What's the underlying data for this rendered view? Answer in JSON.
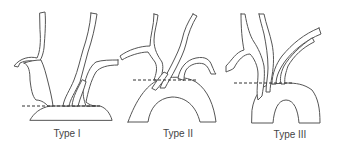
{
  "figure": {
    "panels": [
      {
        "id": "type-1",
        "label": "Type I"
      },
      {
        "id": "type-2",
        "label": "Type II"
      },
      {
        "id": "type-3",
        "label": "Type III"
      }
    ],
    "colors": {
      "outline": "#555555",
      "reference_line": "#333333",
      "label_text": "#444444",
      "background": "#ffffff"
    }
  }
}
